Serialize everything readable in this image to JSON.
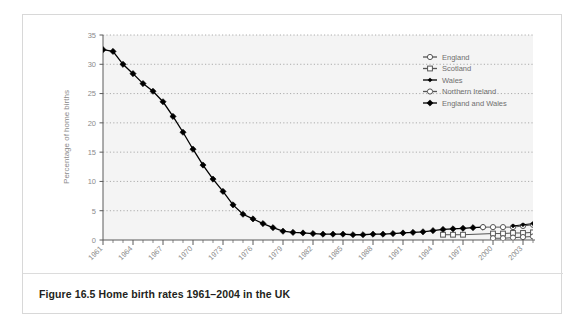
{
  "figure": {
    "caption": "Figure 16.5  Home birth rates 1961–2004 in the UK"
  },
  "chart_data": {
    "type": "line",
    "title": "",
    "xlabel": "Year of survey",
    "ylabel": "Percentage of home births",
    "xlim": [
      1961,
      2004
    ],
    "ylim": [
      0,
      35
    ],
    "yticks": [
      0,
      5,
      10,
      15,
      20,
      25,
      30,
      35
    ],
    "xticks": [
      1961,
      1964,
      1967,
      1970,
      1973,
      1976,
      1979,
      1982,
      1985,
      1988,
      1991,
      1994,
      1997,
      2000,
      2003
    ],
    "grid": "horizontal-dotted",
    "legend_position": "top-right",
    "x": [
      1961,
      1962,
      1963,
      1964,
      1965,
      1966,
      1967,
      1968,
      1969,
      1970,
      1971,
      1972,
      1973,
      1974,
      1975,
      1976,
      1977,
      1978,
      1979,
      1980,
      1981,
      1982,
      1983,
      1984,
      1985,
      1986,
      1987,
      1988,
      1989,
      1990,
      1991,
      1992,
      1993,
      1994,
      1995,
      1996,
      1997,
      1998,
      1999,
      2000,
      2001,
      2002,
      2003,
      2004
    ],
    "series": [
      {
        "name": "England and Wales",
        "marker": "filled-diamond",
        "color": "#000000",
        "x": [
          1961,
          1962,
          1963,
          1964,
          1965,
          1966,
          1967,
          1968,
          1969,
          1970,
          1971,
          1972,
          1973,
          1974,
          1975,
          1976,
          1977,
          1978,
          1979,
          1980,
          1981,
          1982,
          1983,
          1984,
          1985,
          1986,
          1987,
          1988,
          1989,
          1990,
          1991,
          1992,
          1993,
          1994,
          1995,
          1996,
          1997,
          1998,
          1999
        ],
        "values": [
          32.5,
          32.2,
          30.0,
          28.4,
          26.7,
          25.4,
          23.6,
          21.1,
          18.4,
          15.5,
          12.8,
          10.4,
          8.3,
          6.0,
          4.4,
          3.6,
          2.8,
          2.1,
          1.5,
          1.3,
          1.2,
          1.1,
          1.0,
          1.0,
          1.0,
          0.9,
          0.9,
          1.0,
          1.0,
          1.1,
          1.2,
          1.3,
          1.4,
          1.6,
          1.8,
          1.9,
          2.0,
          2.1,
          2.2
        ]
      },
      {
        "name": "England",
        "marker": "open-circle",
        "color": "#555555",
        "x": [
          1999,
          2000,
          2001,
          2002,
          2003,
          2004
        ],
        "values": [
          2.2,
          2.2,
          2.2,
          2.2,
          2.4,
          2.6
        ]
      },
      {
        "name": "Scotland",
        "marker": "open-square",
        "color": "#555555",
        "x": [
          1995,
          1996,
          1997,
          2000,
          2001,
          2002,
          2003,
          2004
        ],
        "values": [
          0.9,
          0.9,
          0.9,
          1.1,
          1.1,
          1.2,
          1.2,
          1.3
        ]
      },
      {
        "name": "Wales",
        "marker": "small-filled-diamond",
        "color": "#000000",
        "x": [
          2002,
          2003,
          2004
        ],
        "values": [
          2.4,
          2.6,
          2.8
        ]
      },
      {
        "name": "Northern Ireland",
        "marker": "open-circle",
        "color": "#555555",
        "x": [
          2000,
          2001,
          2002,
          2003,
          2004
        ],
        "values": [
          0.3,
          0.3,
          0.4,
          0.5,
          0.6
        ]
      }
    ]
  },
  "legend": {
    "items": [
      {
        "label": "England"
      },
      {
        "label": "Scotland"
      },
      {
        "label": "Wales"
      },
      {
        "label": "Northern Ireland"
      },
      {
        "label": "England and Wales"
      }
    ]
  }
}
